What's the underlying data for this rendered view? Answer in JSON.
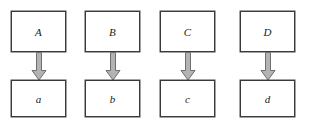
{
  "diagram": {
    "type": "mapping-diagram",
    "background_color": "#ffffff",
    "box_border_color": "#3a3a3a",
    "box_fill_color": "#ffffff",
    "arrow_fill_color": "#b3b3b3",
    "arrow_outline_color": "#6e6e6e",
    "label_color": "#1a1a1a",
    "columns": [
      {
        "source_label": "A",
        "target_label": "a",
        "arrow_name": "arrow-a"
      },
      {
        "source_label": "B",
        "target_label": "b",
        "arrow_name": "arrow-b"
      },
      {
        "source_label": "C",
        "target_label": "c",
        "arrow_name": "arrow-c"
      },
      {
        "source_label": "D",
        "target_label": "d",
        "arrow_name": "arrow-d"
      }
    ]
  }
}
